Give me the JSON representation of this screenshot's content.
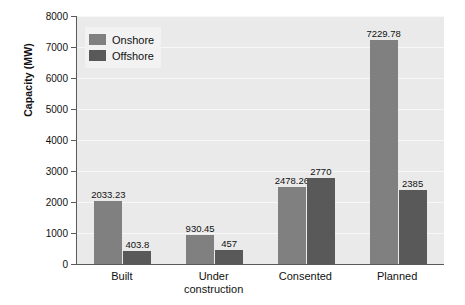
{
  "chart_data": {
    "type": "bar",
    "title": "",
    "xlabel": "",
    "ylabel": "Capacity (MW)",
    "categories": [
      "Built",
      "Under\nconstruction",
      "Consented",
      "Planned"
    ],
    "series": [
      {
        "name": "Onshore",
        "color": "#808080",
        "values": [
          2033.23,
          930.45,
          2478.26,
          7229.78
        ],
        "labels": [
          "2033.23",
          "930.45",
          "2478.26",
          "7229.78"
        ]
      },
      {
        "name": "Offshore",
        "color": "#595959",
        "values": [
          403.8,
          457,
          2770,
          2385
        ],
        "labels": [
          "403.8",
          "457",
          "2770",
          "2385"
        ]
      }
    ],
    "ylim": [
      0,
      8000
    ],
    "yticks": [
      0,
      1000,
      2000,
      3000,
      4000,
      5000,
      6000,
      7000,
      8000
    ],
    "ytick_labels": [
      "0",
      "1000",
      "2000",
      "3000",
      "4000",
      "5000",
      "6000",
      "7000",
      "8000"
    ],
    "grid": true,
    "legend_position": "top-left",
    "plot_background": "#eaeaea",
    "axis_color": "#5a5a5a"
  }
}
